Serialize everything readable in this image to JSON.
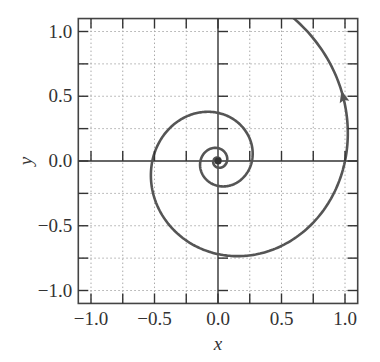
{
  "chart_data": {
    "type": "line",
    "title": "",
    "xlabel": "x",
    "ylabel": "y",
    "xlim": [
      -1.1,
      1.1
    ],
    "ylim": [
      -1.1,
      1.1
    ],
    "xticks": [
      -1.0,
      -0.5,
      0.0,
      0.5,
      1.0
    ],
    "yticks": [
      -1.0,
      -0.5,
      0.0,
      0.5,
      1.0
    ],
    "xtick_labels": [
      "−1.0",
      "−0.5",
      "0.0",
      "0.5",
      "1.0"
    ],
    "ytick_labels": [
      "−1.0",
      "−0.5",
      "0.0",
      "0.5",
      "1.0"
    ],
    "minor_grid_step": 0.25,
    "grid": true,
    "grid_style": "dotted",
    "axes_through_origin": true,
    "series": [
      {
        "name": "spiral trajectory",
        "description": "logarithmic spiral r = exp(0.21*theta), winding inward clockwise to a stable focus at origin",
        "growth_rate_b": 0.21,
        "theta_range": [
          -30,
          1.107
        ],
        "color": "#555555",
        "arrow": {
          "at_point": [
            0.97,
            0.5
          ],
          "direction": "up"
        },
        "key_points": [
          {
            "x": 0.55,
            "y": 1.1
          },
          {
            "x": 1.0,
            "y": 0.0
          },
          {
            "x": 0.0,
            "y": -0.75
          },
          {
            "x": -0.5,
            "y": 0.0
          },
          {
            "x": 0.0,
            "y": 0.37
          },
          {
            "x": 0.27,
            "y": 0.0
          },
          {
            "x": 0.0,
            "y": -0.2
          },
          {
            "x": -0.13,
            "y": 0.0
          },
          {
            "x": 0.0,
            "y": 0.0
          }
        ]
      }
    ],
    "legend": null
  }
}
